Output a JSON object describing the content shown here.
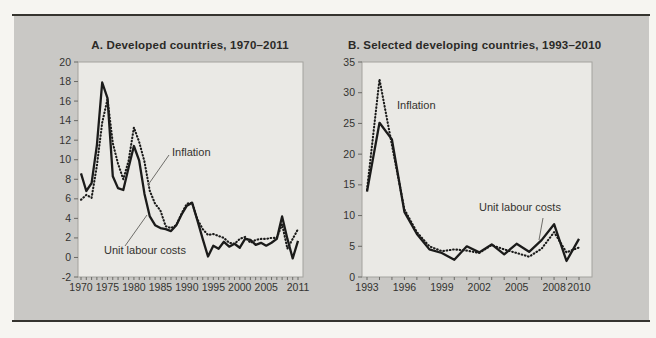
{
  "page": {
    "outer_background": "#f6f5f1",
    "band_background": "#c9c8c5",
    "rule_color": "#35342f",
    "line_color": "#1b1b1a",
    "plot_background": "#eae9e5",
    "plot_border_color": "#a3a29e",
    "tick_color": "#6b6a66",
    "tick_label_color": "#333330"
  },
  "chart_data": [
    {
      "type": "line",
      "title": "A. Developed countries, 1970–2011",
      "xlabel": "",
      "ylabel": "",
      "years": [
        1970,
        1971,
        1972,
        1973,
        1974,
        1975,
        1976,
        1977,
        1978,
        1979,
        1980,
        1981,
        1982,
        1983,
        1984,
        1985,
        1986,
        1987,
        1988,
        1989,
        1990,
        1991,
        1992,
        1993,
        1994,
        1995,
        1996,
        1997,
        1998,
        1999,
        2000,
        2001,
        2002,
        2003,
        2004,
        2005,
        2006,
        2007,
        2008,
        2009,
        2010,
        2011
      ],
      "series": [
        {
          "name": "Inflation",
          "style": "dotted",
          "values": [
            5.9,
            6.4,
            6.1,
            9.4,
            13.8,
            16.2,
            11.7,
            9.6,
            8.0,
            9.9,
            13.3,
            11.8,
            9.8,
            6.8,
            5.5,
            4.8,
            3.2,
            3.0,
            3.3,
            4.5,
            5.5,
            5.6,
            3.9,
            2.9,
            2.3,
            2.4,
            2.2,
            2.0,
            1.5,
            1.4,
            1.9,
            2.1,
            1.5,
            1.8,
            1.9,
            1.9,
            2.0,
            2.0,
            3.4,
            0.9,
            1.9,
            2.9
          ]
        },
        {
          "name": "Unit labour costs",
          "style": "solid",
          "values": [
            8.6,
            6.8,
            7.6,
            11.5,
            17.9,
            16.3,
            8.3,
            7.1,
            6.9,
            9.2,
            11.4,
            9.9,
            6.5,
            4.2,
            3.3,
            3.0,
            2.9,
            2.7,
            3.3,
            4.4,
            5.3,
            5.6,
            3.8,
            1.9,
            0.1,
            1.2,
            0.9,
            1.6,
            1.1,
            1.4,
            1.0,
            1.9,
            1.8,
            1.3,
            1.5,
            1.2,
            1.5,
            1.9,
            4.2,
            1.9,
            -0.1,
            1.7
          ]
        }
      ],
      "ylim": [
        -2,
        20
      ],
      "yticks": [
        -2,
        0,
        2,
        4,
        6,
        8,
        10,
        12,
        14,
        16,
        18,
        20
      ],
      "xtick_years": [
        1970,
        1975,
        1980,
        1985,
        1990,
        1995,
        2000,
        2005,
        2011
      ],
      "grid": false,
      "legend_position": "inline-annotations",
      "annotations": [
        {
          "text": "Inflation",
          "leader": [
            [
              148,
              185
            ],
            [
              169,
              155
            ]
          ]
        },
        {
          "text": "Unit labour costs",
          "leader": [
            [
              125,
              246
            ],
            [
              147,
              215
            ]
          ]
        }
      ],
      "layout": {
        "left": 78,
        "top": 62,
        "width": 225,
        "height": 215,
        "pad_left": 3,
        "pad_right": 5
      }
    },
    {
      "type": "line",
      "title": "B. Selected developing countries, 1993–2010",
      "xlabel": "",
      "ylabel": "",
      "years": [
        1993,
        1994,
        1995,
        1996,
        1997,
        1998,
        1999,
        2000,
        2001,
        2002,
        2003,
        2004,
        2005,
        2006,
        2007,
        2008,
        2009,
        2010
      ],
      "series": [
        {
          "name": "Inflation",
          "style": "dotted",
          "values": [
            14.2,
            32.2,
            21.5,
            11.0,
            7.3,
            5.0,
            4.2,
            4.5,
            4.3,
            3.9,
            5.2,
            4.5,
            3.9,
            3.3,
            4.6,
            7.3,
            4.0,
            4.8
          ]
        },
        {
          "name": "Unit labour costs",
          "style": "solid",
          "values": [
            13.9,
            25.1,
            22.4,
            10.6,
            7.0,
            4.5,
            3.9,
            2.8,
            5.0,
            4.0,
            5.3,
            3.7,
            5.4,
            4.1,
            6.0,
            8.6,
            2.6,
            6.2
          ]
        }
      ],
      "ylim": [
        0,
        35
      ],
      "yticks": [
        0,
        5,
        10,
        15,
        20,
        25,
        30,
        35
      ],
      "xtick_years": [
        1993,
        1996,
        1999,
        2002,
        2005,
        2008,
        2010
      ],
      "grid": false,
      "legend_position": "inline-annotations",
      "annotations": [
        {
          "text": "Inflation",
          "leader": null
        },
        {
          "text": "Unit labour costs",
          "leader": [
            [
              543,
              218
            ],
            [
              539,
              240
            ]
          ]
        }
      ],
      "layout": {
        "left": 362,
        "top": 62,
        "width": 230,
        "height": 215,
        "pad_left": 5,
        "pad_right": 13
      }
    }
  ]
}
